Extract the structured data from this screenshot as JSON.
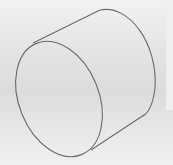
{
  "viewport": {
    "background_color": "#e2e2e2",
    "edge_color": "#6a6a6a"
  },
  "model": {
    "shape": "cylinder",
    "display_mode": "wireframe",
    "edges": [
      "front-face-circle",
      "back-face-arc",
      "top-silhouette-line",
      "bottom-silhouette-line"
    ]
  }
}
